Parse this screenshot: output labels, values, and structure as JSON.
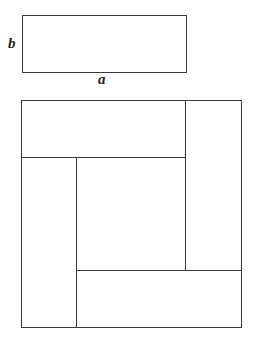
{
  "diagram": {
    "small_rectangle": {
      "side_labels": {
        "horizontal": "a",
        "vertical": "b"
      }
    },
    "large_square": {
      "pieces": 4,
      "inner_square": true
    },
    "colors": {
      "stroke": "#3a3a3a",
      "background": "#ffffff"
    }
  }
}
